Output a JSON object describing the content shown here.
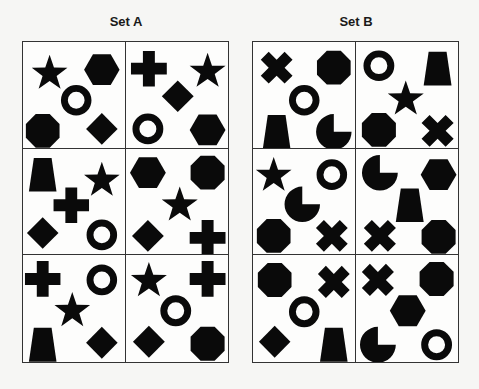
{
  "sets": [
    {
      "title": "Set A",
      "cells": [
        {
          "shapes": [
            {
              "type": "star",
              "x": 27,
              "y": 30
            },
            {
              "type": "hexagon",
              "x": 80,
              "y": 28
            },
            {
              "type": "ring",
              "x": 54,
              "y": 59
            },
            {
              "type": "octagon",
              "x": 20,
              "y": 90
            },
            {
              "type": "diamond",
              "x": 80,
              "y": 88
            }
          ]
        },
        {
          "shapes": [
            {
              "type": "cross",
              "x": 23,
              "y": 27
            },
            {
              "type": "star",
              "x": 82,
              "y": 28
            },
            {
              "type": "diamond",
              "x": 52,
              "y": 55
            },
            {
              "type": "ring",
              "x": 22,
              "y": 88
            },
            {
              "type": "hexagon",
              "x": 82,
              "y": 89
            }
          ]
        },
        {
          "shapes": [
            {
              "type": "trapezoid",
              "x": 20,
              "y": 26
            },
            {
              "type": "star",
              "x": 80,
              "y": 30
            },
            {
              "type": "cross",
              "x": 49,
              "y": 57
            },
            {
              "type": "diamond",
              "x": 20,
              "y": 85
            },
            {
              "type": "ring",
              "x": 80,
              "y": 87
            }
          ]
        },
        {
          "shapes": [
            {
              "type": "hexagon",
              "x": 22,
              "y": 24
            },
            {
              "type": "octagon",
              "x": 82,
              "y": 24
            },
            {
              "type": "star",
              "x": 54,
              "y": 55
            },
            {
              "type": "diamond",
              "x": 22,
              "y": 88
            },
            {
              "type": "cross",
              "x": 82,
              "y": 90
            }
          ]
        },
        {
          "shapes": [
            {
              "type": "cross",
              "x": 20,
              "y": 24
            },
            {
              "type": "ring",
              "x": 80,
              "y": 25
            },
            {
              "type": "star",
              "x": 50,
              "y": 54
            },
            {
              "type": "trapezoid",
              "x": 20,
              "y": 90
            },
            {
              "type": "diamond",
              "x": 80,
              "y": 88
            }
          ]
        },
        {
          "shapes": [
            {
              "type": "star",
              "x": 23,
              "y": 24
            },
            {
              "type": "cross",
              "x": 82,
              "y": 24
            },
            {
              "type": "ring",
              "x": 50,
              "y": 56
            },
            {
              "type": "diamond",
              "x": 23,
              "y": 87
            },
            {
              "type": "octagon",
              "x": 82,
              "y": 89
            }
          ]
        }
      ]
    },
    {
      "title": "Set B",
      "cells": [
        {
          "shapes": [
            {
              "type": "x-cross",
              "x": 24,
              "y": 26
            },
            {
              "type": "octagon",
              "x": 82,
              "y": 26
            },
            {
              "type": "ring",
              "x": 52,
              "y": 59
            },
            {
              "type": "trapezoid",
              "x": 24,
              "y": 91
            },
            {
              "type": "pacman",
              "x": 82,
              "y": 91
            }
          ]
        },
        {
          "shapes": [
            {
              "type": "ring",
              "x": 23,
              "y": 24
            },
            {
              "type": "trapezoid",
              "x": 82,
              "y": 27
            },
            {
              "type": "star",
              "x": 50,
              "y": 56
            },
            {
              "type": "octagon",
              "x": 23,
              "y": 89
            },
            {
              "type": "x-cross",
              "x": 82,
              "y": 90
            }
          ]
        },
        {
          "shapes": [
            {
              "type": "star",
              "x": 21,
              "y": 25
            },
            {
              "type": "ring",
              "x": 80,
              "y": 26
            },
            {
              "type": "pacman",
              "x": 50,
              "y": 56
            },
            {
              "type": "octagon",
              "x": 21,
              "y": 88
            },
            {
              "type": "x-cross",
              "x": 80,
              "y": 88
            }
          ]
        },
        {
          "shapes": [
            {
              "type": "pacman",
              "x": 24,
              "y": 24
            },
            {
              "type": "hexagon",
              "x": 83,
              "y": 26
            },
            {
              "type": "trapezoid",
              "x": 54,
              "y": 57
            },
            {
              "type": "x-cross",
              "x": 24,
              "y": 88
            },
            {
              "type": "octagon",
              "x": 83,
              "y": 89
            }
          ]
        },
        {
          "shapes": [
            {
              "type": "octagon",
              "x": 22,
              "y": 25
            },
            {
              "type": "x-cross",
              "x": 82,
              "y": 27
            },
            {
              "type": "ring",
              "x": 52,
              "y": 57
            },
            {
              "type": "diamond",
              "x": 22,
              "y": 87
            },
            {
              "type": "trapezoid",
              "x": 82,
              "y": 90
            }
          ]
        },
        {
          "shapes": [
            {
              "type": "x-cross",
              "x": 22,
              "y": 25
            },
            {
              "type": "octagon",
              "x": 81,
              "y": 24
            },
            {
              "type": "hexagon",
              "x": 52,
              "y": 56
            },
            {
              "type": "pacman",
              "x": 22,
              "y": 90
            },
            {
              "type": "ring",
              "x": 81,
              "y": 90
            }
          ]
        }
      ]
    }
  ],
  "colors": {
    "shape": "#0a0a0a",
    "border": "#333333",
    "background": "#f6f6f4"
  }
}
